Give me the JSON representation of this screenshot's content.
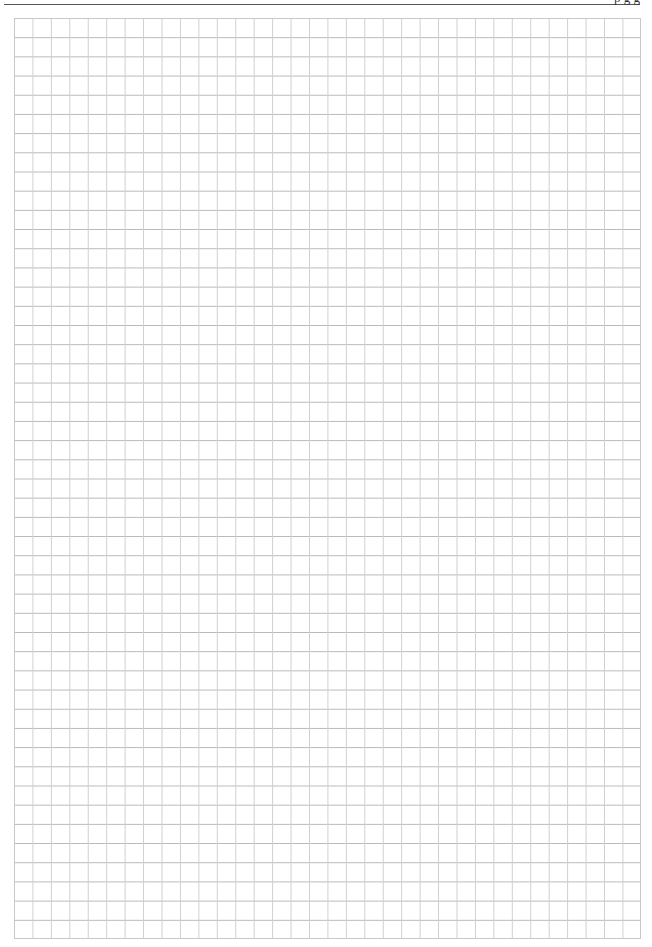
{
  "header": {
    "text": "p g g"
  },
  "grid": {
    "columns": 34,
    "rows": 48,
    "line_color": "#c8c8c8",
    "background": "#ffffff"
  }
}
